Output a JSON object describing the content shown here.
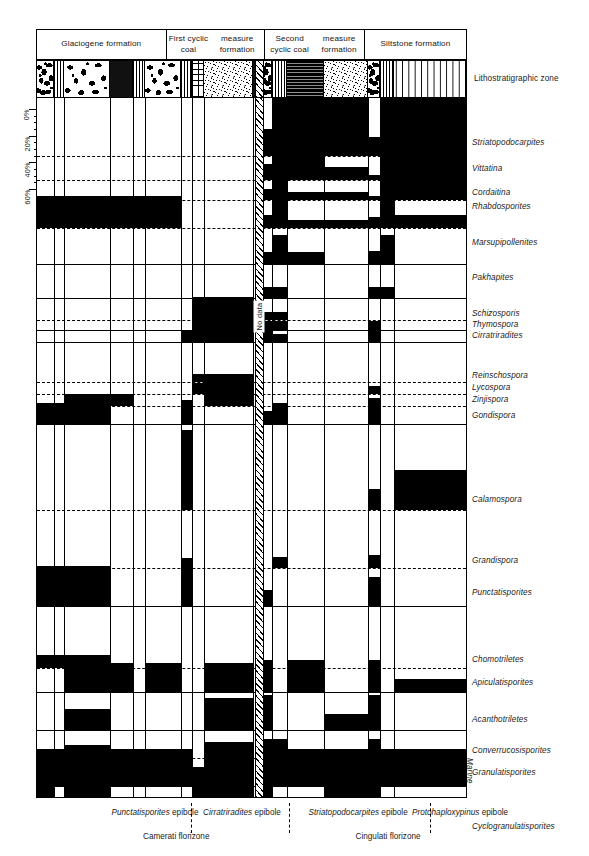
{
  "figure": {
    "kind": "palynological range and abundance diagram",
    "lithostratigraphic_zone_label": "Lithostratigraphic zone",
    "no_data_label": "No data",
    "marine_label": "Marine"
  },
  "percent_axis": {
    "labels": [
      "0%",
      "20%",
      "40%",
      "60%"
    ],
    "values": [
      0,
      20,
      40,
      60
    ],
    "max": 60
  },
  "formations": [
    {
      "label": "Glaciogene  formation",
      "x": 0,
      "width": 128.5
    },
    {
      "label": "First cyclic coal\nmeasure formation",
      "x": 128.5,
      "width": 98.5
    },
    {
      "label": "Second cyclic coal\nmeasure formation",
      "x": 227,
      "width": 100
    },
    {
      "label": "Siltstone formation",
      "x": 327,
      "width": 102
    }
  ],
  "lithology": [
    {
      "name": "conglomerate",
      "pattern": "p-cong",
      "x": 0,
      "width": 17
    },
    {
      "name": "striped-diamictite",
      "pattern": "p-vstripe",
      "x": 17,
      "width": 10
    },
    {
      "name": "conglomerate",
      "pattern": "p-cong",
      "x": 27,
      "width": 46
    },
    {
      "name": "dark-shale",
      "pattern": "p-dark",
      "x": 73,
      "width": 23
    },
    {
      "name": "striped-diamictite",
      "pattern": "p-vstripe",
      "x": 96,
      "width": 12
    },
    {
      "name": "conglomerate",
      "pattern": "p-cong",
      "x": 108,
      "width": 36
    },
    {
      "name": "striped-diamictite",
      "pattern": "p-vstripe",
      "x": 144,
      "width": 11
    },
    {
      "name": "coal-measure",
      "pattern": "p-brick",
      "x": 155,
      "width": 12
    },
    {
      "name": "sandstone",
      "pattern": "p-sand",
      "x": 167,
      "width": 49
    },
    {
      "name": "dark-shale",
      "pattern": "p-dark",
      "x": 216,
      "width": 9
    },
    {
      "name": "conglomerate",
      "pattern": "p-cong",
      "x": 225,
      "width": 10
    },
    {
      "name": "striped-diamictite",
      "pattern": "p-vstripe",
      "x": 235,
      "width": 15
    },
    {
      "name": "coal-measure",
      "pattern": "p-coal",
      "x": 250,
      "width": 37
    },
    {
      "name": "sandstone",
      "pattern": "p-sand",
      "x": 287,
      "width": 44
    },
    {
      "name": "conglomerate",
      "pattern": "p-cong",
      "x": 331,
      "width": 12
    },
    {
      "name": "striped-diamictite",
      "pattern": "p-vstripe",
      "x": 343,
      "width": 14
    },
    {
      "name": "siltstone",
      "pattern": "p-siltdash",
      "x": 357,
      "width": 72
    }
  ],
  "column_separators": [
    17,
    27,
    73,
    96,
    108,
    144,
    155,
    167,
    216,
    225,
    235,
    250,
    287,
    331,
    343,
    357
  ],
  "no_data_band": {
    "x": 217.5,
    "width": 9.5
  },
  "taxa": [
    {
      "name": "Striatopodocarpites",
      "y": 45
    },
    {
      "name": "Vittatina",
      "y": 71
    },
    {
      "name": "Cordaitina",
      "y": 95
    },
    {
      "name": "Rhabdosporites",
      "y": 109
    },
    {
      "name": "Marsupipollenites",
      "y": 145
    },
    {
      "name": "Pakhapites",
      "y": 180
    },
    {
      "name": "Schizosporis",
      "y": 216
    },
    {
      "name": "Thymospora",
      "y": 227
    },
    {
      "name": "Cirratriradites",
      "y": 238
    },
    {
      "name": "Reinschospora",
      "y": 278
    },
    {
      "name": "Lycospora",
      "y": 290
    },
    {
      "name": "Zinjispora",
      "y": 302
    },
    {
      "name": "Gondispora",
      "y": 318
    },
    {
      "name": "Calamospora",
      "y": 402
    },
    {
      "name": "Grandispora",
      "y": 463
    },
    {
      "name": "Punctatisporites",
      "y": 495
    },
    {
      "name": "Chomotriletes",
      "y": 562
    },
    {
      "name": "Apiculatisporites",
      "y": 585
    },
    {
      "name": "Acanthotriletes",
      "y": 622
    },
    {
      "name": "Converrucosisporites",
      "y": 653
    },
    {
      "name": "Granulatisporites",
      "y": 675
    },
    {
      "name": "Cyclogranulatisporites",
      "y": 729
    }
  ],
  "epiboles": [
    {
      "taxon": "Punctatisporites",
      "suffix": " epibole",
      "center": 119
    },
    {
      "taxon": "Cirratriradites",
      "suffix": " epibole",
      "center": 206
    },
    {
      "taxon": "Striatopodocarpites",
      "suffix": " epibole",
      "center": 322
    },
    {
      "taxon": "Protohaploxypinus",
      "suffix": " epibole",
      "center": 424
    }
  ],
  "epibole_separators": [
    155,
    253,
    394
  ],
  "florizones": [
    {
      "label": "Camerati  florizone",
      "center": 140
    },
    {
      "label": "Cingulati  florizone",
      "center": 352
    }
  ],
  "chart_data": {
    "type": "bar",
    "xlabel": "Lithostratigraphic zone",
    "ylabel": "Relative abundance (%)",
    "ylim": [
      0,
      60
    ],
    "grid": "dashed horizontal per-taxon baselines",
    "legend": "none",
    "note": "Each taxon occupies one horizontal track; filled black blocks are abundance bars drawn upward from that taxon's baseline, per lithostratigraphic column.",
    "sample_columns": [
      {
        "id": "c1",
        "x": 0,
        "width": 17,
        "formation": "Glaciogene formation"
      },
      {
        "id": "c2",
        "x": 17,
        "width": 10,
        "formation": "Glaciogene formation"
      },
      {
        "id": "c3",
        "x": 27,
        "width": 46,
        "formation": "Glaciogene formation"
      },
      {
        "id": "c4",
        "x": 73,
        "width": 23,
        "formation": "Glaciogene formation"
      },
      {
        "id": "c5",
        "x": 96,
        "width": 12,
        "formation": "Glaciogene formation"
      },
      {
        "id": "c6",
        "x": 108,
        "width": 36,
        "formation": "Glaciogene formation"
      },
      {
        "id": "c7",
        "x": 144,
        "width": 11,
        "formation": "First cyclic coal measure formation"
      },
      {
        "id": "c8",
        "x": 155,
        "width": 12,
        "formation": "First cyclic coal measure formation"
      },
      {
        "id": "c9",
        "x": 167,
        "width": 49,
        "formation": "First cyclic coal measure formation"
      },
      {
        "id": "c10",
        "x": 227,
        "width": 8,
        "formation": "Second cyclic coal measure formation"
      },
      {
        "id": "c11",
        "x": 235,
        "width": 15,
        "formation": "Second cyclic coal measure formation"
      },
      {
        "id": "c12",
        "x": 250,
        "width": 37,
        "formation": "Second cyclic coal measure formation"
      },
      {
        "id": "c13",
        "x": 287,
        "width": 44,
        "formation": "Second cyclic coal measure formation"
      },
      {
        "id": "c14",
        "x": 331,
        "width": 12,
        "formation": "Siltstone formation"
      },
      {
        "id": "c15",
        "x": 343,
        "width": 14,
        "formation": "Siltstone formation"
      },
      {
        "id": "c16",
        "x": 357,
        "width": 72,
        "formation": "Siltstone formation"
      }
    ],
    "tracks": [
      {
        "taxon": "Striatopodocarpites",
        "baseline": 58,
        "style": "dashed",
        "bars": [
          [
            227,
            8,
            20
          ],
          [
            235,
            15,
            44
          ],
          [
            250,
            37,
            44
          ],
          [
            287,
            44,
            58
          ],
          [
            331,
            12,
            14
          ],
          [
            343,
            14,
            58
          ],
          [
            357,
            72,
            58
          ]
        ]
      },
      {
        "taxon": "Vittatina",
        "baseline": 82,
        "style": "dashed",
        "bars": [
          [
            227,
            8,
            12
          ],
          [
            235,
            15,
            24
          ],
          [
            250,
            37,
            24
          ],
          [
            287,
            44,
            10
          ],
          [
            331,
            12,
            4
          ],
          [
            343,
            14,
            24
          ],
          [
            357,
            72,
            24
          ]
        ]
      },
      {
        "taxon": "Cordaitina",
        "baseline": 102,
        "style": "dashed",
        "bars": [
          [
            227,
            8,
            8
          ],
          [
            235,
            15,
            20
          ],
          [
            250,
            37,
            6
          ],
          [
            287,
            44,
            6
          ],
          [
            331,
            12,
            3
          ],
          [
            343,
            14,
            20
          ],
          [
            357,
            72,
            20
          ]
        ]
      },
      {
        "taxon": "Rhabdosporites",
        "baseline": 130,
        "style": "dashed",
        "bars": [
          [
            0,
            73,
            10
          ],
          [
            0,
            96,
            24
          ],
          [
            96,
            12,
            24
          ],
          [
            108,
            36,
            24
          ],
          [
            227,
            8,
            10
          ],
          [
            235,
            15,
            28
          ],
          [
            250,
            37,
            6
          ],
          [
            287,
            44,
            6
          ],
          [
            331,
            12,
            8
          ],
          [
            343,
            14,
            28
          ],
          [
            357,
            72,
            10
          ]
        ]
      },
      {
        "taxon": "Marsupipollenites",
        "baseline": 166,
        "style": "solid",
        "bars": [
          [
            227,
            8,
            9
          ],
          [
            235,
            15,
            22
          ],
          [
            250,
            37,
            9
          ],
          [
            331,
            12,
            10
          ],
          [
            343,
            14,
            22
          ]
        ]
      },
      {
        "taxon": "Pakhapites",
        "baseline": 200,
        "style": "solid",
        "bars": [
          [
            227,
            8,
            8
          ],
          [
            235,
            15,
            8
          ],
          [
            331,
            12,
            8
          ],
          [
            343,
            14,
            8
          ]
        ]
      },
      {
        "taxon": "Schizosporis",
        "baseline": 222,
        "style": "dashed",
        "bars": [
          [
            167,
            49,
            6
          ],
          [
            227,
            8,
            6
          ],
          [
            235,
            15,
            6
          ]
        ]
      },
      {
        "taxon": "Thymospora",
        "baseline": 232,
        "style": "solid",
        "bars": [
          [
            167,
            49,
            7
          ],
          [
            227,
            8,
            7
          ],
          [
            235,
            15,
            7
          ],
          [
            331,
            12,
            7
          ]
        ]
      },
      {
        "taxon": "Cirratriradites",
        "baseline": 244,
        "style": "solid",
        "bars": [
          [
            144,
            11,
            8
          ],
          [
            155,
            12,
            34
          ],
          [
            167,
            49,
            34
          ],
          [
            227,
            8,
            10
          ],
          [
            235,
            15,
            6
          ],
          [
            331,
            12,
            12
          ]
        ]
      },
      {
        "taxon": "Reinschospora",
        "baseline": 284,
        "style": "dashed",
        "bars": [
          [
            155,
            12,
            6
          ],
          [
            167,
            49,
            6
          ]
        ]
      },
      {
        "taxon": "Lycospora",
        "baseline": 296,
        "style": "dashed",
        "bars": [
          [
            155,
            12,
            8
          ],
          [
            167,
            49,
            12
          ],
          [
            331,
            12,
            6
          ]
        ]
      },
      {
        "taxon": "Zinjispora",
        "baseline": 308,
        "style": "dashed",
        "bars": [
          [
            27,
            46,
            9
          ],
          [
            73,
            23,
            9
          ],
          [
            167,
            49,
            9
          ],
          [
            331,
            12,
            6
          ]
        ]
      },
      {
        "taxon": "Gondispora",
        "baseline": 326,
        "style": "solid",
        "bars": [
          [
            0,
            73,
            16
          ],
          [
            27,
            46,
            9
          ],
          [
            144,
            11,
            18
          ],
          [
            227,
            8,
            10
          ],
          [
            235,
            15,
            16
          ],
          [
            331,
            12,
            16
          ]
        ]
      },
      {
        "taxon": "Calamospora",
        "baseline": 412,
        "style": "dashed",
        "bars": [
          [
            144,
            11,
            60
          ],
          [
            331,
            12,
            16
          ],
          [
            357,
            72,
            30
          ]
        ]
      },
      {
        "taxon": "Grandispora",
        "baseline": 470,
        "style": "dashed",
        "bars": [
          [
            235,
            15,
            8
          ],
          [
            331,
            12,
            10
          ]
        ]
      },
      {
        "taxon": "Punctatisporites",
        "baseline": 508,
        "style": "solid",
        "bars": [
          [
            0,
            73,
            30
          ],
          [
            27,
            46,
            12
          ],
          [
            144,
            11,
            36
          ],
          [
            227,
            8,
            12
          ],
          [
            331,
            12,
            22
          ]
        ]
      },
      {
        "taxon": "Chomotriletes",
        "baseline": 570,
        "style": "dashed",
        "bars": [
          [
            0,
            73,
            10
          ],
          [
            27,
            46,
            10
          ],
          [
            331,
            12,
            6
          ]
        ]
      },
      {
        "taxon": "Apiculatisporites",
        "baseline": 594,
        "style": "solid",
        "bars": [
          [
            27,
            46,
            22
          ],
          [
            73,
            23,
            22
          ],
          [
            108,
            36,
            22
          ],
          [
            167,
            49,
            22
          ],
          [
            227,
            8,
            24
          ],
          [
            250,
            37,
            24
          ],
          [
            331,
            12,
            24
          ],
          [
            357,
            72,
            10
          ]
        ]
      },
      {
        "taxon": "Acanthotriletes",
        "baseline": 632,
        "style": "solid",
        "bars": [
          [
            27,
            46,
            16
          ],
          [
            167,
            49,
            24
          ],
          [
            227,
            8,
            26
          ],
          [
            287,
            44,
            12
          ],
          [
            331,
            12,
            26
          ]
        ]
      },
      {
        "taxon": "Converrucosisporites",
        "baseline": 660,
        "style": "dashed",
        "bars": [
          [
            27,
            46,
            10
          ],
          [
            167,
            49,
            12
          ],
          [
            227,
            8,
            14
          ],
          [
            235,
            15,
            14
          ],
          [
            331,
            12,
            14
          ]
        ]
      },
      {
        "taxon": "Granulatisporites",
        "baseline": 688,
        "style": "solid",
        "bars": [
          [
            0,
            144,
            28
          ],
          [
            144,
            11,
            28
          ],
          [
            167,
            49,
            28
          ],
          [
            227,
            8,
            28
          ],
          [
            235,
            15,
            28
          ],
          [
            250,
            37,
            28
          ],
          [
            287,
            44,
            28
          ],
          [
            331,
            12,
            28
          ],
          [
            343,
            14,
            28
          ],
          [
            357,
            72,
            28
          ]
        ]
      },
      {
        "taxon": "Cyclogranulatisporites",
        "baseline": 744,
        "style": "dashed",
        "bars": [
          [
            0,
            17,
            56
          ],
          [
            27,
            46,
            56
          ],
          [
            73,
            23,
            30
          ],
          [
            155,
            12,
            56
          ],
          [
            167,
            49,
            56
          ],
          [
            227,
            8,
            56
          ],
          [
            250,
            37,
            30
          ],
          [
            287,
            44,
            56
          ],
          [
            331,
            12,
            56
          ],
          [
            343,
            14,
            20
          ],
          [
            357,
            72,
            20
          ]
        ]
      },
      {
        "taxon": "Marine",
        "baseline": 790,
        "style": "solid",
        "bars": [
          [
            144,
            11,
            32
          ],
          [
            227,
            8,
            32
          ],
          [
            235,
            15,
            32
          ],
          [
            250,
            37,
            32
          ],
          [
            331,
            12,
            32
          ],
          [
            343,
            14,
            32
          ]
        ]
      }
    ]
  }
}
